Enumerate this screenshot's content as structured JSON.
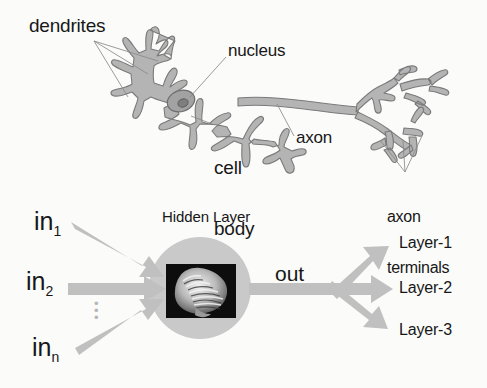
{
  "figure": {
    "background_color": "#fbfbfa",
    "ink_color": "#171717",
    "neuron_fill": "#b4b4b4",
    "neuron_stroke": "#7c7c7c",
    "arrow_color": "#c0c0c0",
    "circle_color": "#c9c9c9",
    "pointer_line_color": "#8a8a8a"
  },
  "neuron_diagram": {
    "labels": {
      "dendrites": "dendrites",
      "nucleus": "nucleus",
      "cell_body_line1": "cell",
      "cell_body_line2": "body",
      "axon": "axon",
      "axon_terminals_line1": "axon",
      "axon_terminals_line2": "terminals"
    },
    "parts": [
      "dendrites",
      "nucleus",
      "cell body",
      "axon",
      "axon terminals"
    ]
  },
  "network_diagram": {
    "inputs": [
      {
        "base": "in",
        "sub": "1"
      },
      {
        "base": "in",
        "sub": "2"
      },
      {
        "base": "in",
        "sub": "n"
      }
    ],
    "input_ellipsis": "⋮",
    "hidden_layer_label": "Hidden Layer",
    "hidden_layer_image": "brain-mri-image",
    "output_label": "out",
    "outputs": [
      "Layer-1",
      "Layer-2",
      "Layer-3"
    ]
  }
}
